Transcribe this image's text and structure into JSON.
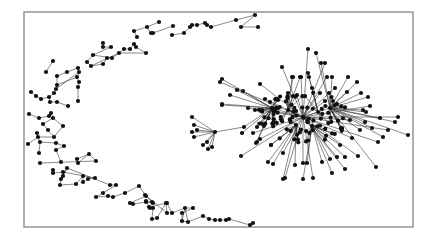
{
  "diagram": {
    "type": "network-graph",
    "caption": "",
    "frame": {
      "x": 24,
      "y": 12,
      "width": 389,
      "height": 215,
      "color": "#7a7a7a"
    },
    "node_color": "#111111",
    "edge_color": "#3a3a3a",
    "node_radius": 2.1,
    "arc_nodes": [
      [
        134,
        31
      ],
      [
        147,
        27
      ],
      [
        159,
        22
      ],
      [
        151,
        33
      ],
      [
        153,
        33
      ],
      [
        137,
        37
      ],
      [
        173,
        26
      ],
      [
        172,
        35
      ],
      [
        184,
        33
      ],
      [
        190,
        27
      ],
      [
        192,
        25
      ],
      [
        197,
        25
      ],
      [
        205,
        23
      ],
      [
        207,
        25
      ],
      [
        211,
        27
      ],
      [
        236,
        20
      ],
      [
        255,
        15
      ],
      [
        241,
        27
      ],
      [
        258,
        27
      ],
      [
        53,
        61
      ],
      [
        46,
        72
      ],
      [
        57,
        76
      ],
      [
        67,
        72
      ],
      [
        78,
        68
      ],
      [
        79,
        72
      ],
      [
        77,
        77
      ],
      [
        79,
        82
      ],
      [
        78,
        87
      ],
      [
        78,
        101
      ],
      [
        57,
        85
      ],
      [
        56,
        89
      ],
      [
        54,
        93
      ],
      [
        31,
        92
      ],
      [
        36,
        96
      ],
      [
        41,
        99
      ],
      [
        49,
        97
      ],
      [
        50,
        102
      ],
      [
        57,
        102
      ],
      [
        68,
        106
      ],
      [
        103,
        43
      ],
      [
        103,
        47
      ],
      [
        111,
        47
      ],
      [
        93,
        55
      ],
      [
        87,
        62
      ],
      [
        91,
        66
      ],
      [
        103,
        64
      ],
      [
        107,
        58
      ],
      [
        112,
        58
      ],
      [
        119,
        53
      ],
      [
        124,
        49
      ],
      [
        130,
        49
      ],
      [
        134,
        44
      ],
      [
        136,
        47
      ],
      [
        146,
        53
      ],
      [
        29,
        114
      ],
      [
        39,
        118
      ],
      [
        49,
        116
      ],
      [
        51,
        113
      ],
      [
        53,
        118
      ],
      [
        43,
        124
      ],
      [
        48,
        130
      ],
      [
        63,
        126
      ],
      [
        54,
        137
      ],
      [
        37,
        133
      ],
      [
        38,
        137
      ],
      [
        28,
        144
      ],
      [
        40,
        142
      ],
      [
        39,
        153
      ],
      [
        56,
        143
      ],
      [
        64,
        146
      ],
      [
        56,
        150
      ],
      [
        61,
        162
      ],
      [
        77,
        159
      ],
      [
        89,
        154
      ],
      [
        78,
        163
      ],
      [
        96,
        161
      ],
      [
        40,
        163
      ],
      [
        53,
        170
      ],
      [
        53,
        173
      ],
      [
        63,
        172
      ],
      [
        63,
        176
      ],
      [
        67,
        168
      ],
      [
        61,
        179
      ],
      [
        60,
        185
      ],
      [
        76,
        184
      ],
      [
        83,
        176
      ],
      [
        83,
        182
      ],
      [
        88,
        179
      ],
      [
        95,
        178
      ],
      [
        110,
        185
      ],
      [
        116,
        185
      ],
      [
        103,
        193
      ],
      [
        96,
        197
      ],
      [
        108,
        196
      ],
      [
        113,
        197
      ],
      [
        125,
        193
      ],
      [
        139,
        186
      ],
      [
        146,
        196
      ],
      [
        130,
        203
      ],
      [
        133,
        204
      ],
      [
        146,
        202
      ],
      [
        152,
        202
      ],
      [
        150,
        208
      ],
      [
        153,
        208
      ],
      [
        152,
        219
      ],
      [
        157,
        218
      ],
      [
        166,
        203
      ],
      [
        167,
        213
      ],
      [
        145,
        195
      ],
      [
        146,
        201
      ],
      [
        153,
        203
      ],
      [
        149,
        207
      ],
      [
        167,
        203
      ],
      [
        172,
        213
      ],
      [
        185,
        208
      ],
      [
        193,
        208
      ],
      [
        182,
        213
      ],
      [
        182,
        221
      ],
      [
        188,
        222
      ],
      [
        203,
        216
      ],
      [
        209,
        219
      ],
      [
        215,
        220
      ],
      [
        220,
        220
      ],
      [
        226,
        220
      ],
      [
        229,
        219
      ],
      [
        250,
        225
      ],
      [
        253,
        223
      ]
    ],
    "arc_edges": [
      [
        0,
        1
      ],
      [
        1,
        2
      ],
      [
        1,
        3
      ],
      [
        3,
        4
      ],
      [
        0,
        5
      ],
      [
        4,
        6
      ],
      [
        7,
        8
      ],
      [
        8,
        9
      ],
      [
        9,
        10
      ],
      [
        10,
        11
      ],
      [
        11,
        12
      ],
      [
        12,
        13
      ],
      [
        13,
        14
      ],
      [
        14,
        15
      ],
      [
        15,
        16
      ],
      [
        16,
        17
      ],
      [
        17,
        18
      ],
      [
        19,
        20
      ],
      [
        21,
        22
      ],
      [
        22,
        23
      ],
      [
        23,
        24
      ],
      [
        24,
        25
      ],
      [
        25,
        26
      ],
      [
        26,
        27
      ],
      [
        27,
        28
      ],
      [
        21,
        29
      ],
      [
        29,
        30
      ],
      [
        30,
        31
      ],
      [
        29,
        25
      ],
      [
        30,
        24
      ],
      [
        32,
        33
      ],
      [
        33,
        34
      ],
      [
        34,
        35
      ],
      [
        35,
        36
      ],
      [
        36,
        37
      ],
      [
        37,
        38
      ],
      [
        35,
        31
      ],
      [
        39,
        40
      ],
      [
        40,
        41
      ],
      [
        41,
        42
      ],
      [
        42,
        43
      ],
      [
        43,
        44
      ],
      [
        44,
        45
      ],
      [
        45,
        46
      ],
      [
        46,
        47
      ],
      [
        47,
        48
      ],
      [
        48,
        49
      ],
      [
        49,
        50
      ],
      [
        50,
        51
      ],
      [
        51,
        52
      ],
      [
        52,
        53
      ],
      [
        42,
        47
      ],
      [
        44,
        48
      ],
      [
        48,
        53
      ],
      [
        54,
        55
      ],
      [
        55,
        56
      ],
      [
        56,
        57
      ],
      [
        57,
        58
      ],
      [
        58,
        59
      ],
      [
        59,
        60
      ],
      [
        58,
        61
      ],
      [
        60,
        62
      ],
      [
        61,
        62
      ],
      [
        63,
        64
      ],
      [
        64,
        65
      ],
      [
        64,
        66
      ],
      [
        66,
        67
      ],
      [
        66,
        68
      ],
      [
        68,
        69
      ],
      [
        69,
        70
      ],
      [
        70,
        71
      ],
      [
        62,
        64
      ],
      [
        72,
        73
      ],
      [
        73,
        74
      ],
      [
        73,
        75
      ],
      [
        75,
        76
      ],
      [
        77,
        78
      ],
      [
        78,
        79
      ],
      [
        79,
        80
      ],
      [
        80,
        81
      ],
      [
        81,
        82
      ],
      [
        82,
        83
      ],
      [
        83,
        84
      ],
      [
        84,
        85
      ],
      [
        85,
        86
      ],
      [
        86,
        87
      ],
      [
        87,
        88
      ],
      [
        81,
        89
      ],
      [
        79,
        88
      ],
      [
        89,
        90
      ],
      [
        90,
        91
      ],
      [
        91,
        92
      ],
      [
        92,
        93
      ],
      [
        93,
        94
      ],
      [
        94,
        95
      ],
      [
        95,
        96
      ],
      [
        96,
        97
      ],
      [
        97,
        98
      ],
      [
        98,
        99
      ],
      [
        99,
        100
      ],
      [
        100,
        101
      ],
      [
        97,
        101
      ],
      [
        102,
        103
      ],
      [
        103,
        104
      ],
      [
        104,
        105
      ],
      [
        105,
        106
      ],
      [
        106,
        107
      ],
      [
        107,
        108
      ],
      [
        109,
        110
      ],
      [
        110,
        111
      ],
      [
        111,
        112
      ],
      [
        112,
        113
      ],
      [
        113,
        114
      ],
      [
        114,
        115
      ],
      [
        115,
        116
      ],
      [
        116,
        117
      ],
      [
        117,
        118
      ],
      [
        118,
        119
      ],
      [
        119,
        120
      ],
      [
        120,
        121
      ],
      [
        121,
        122
      ],
      [
        122,
        123
      ],
      [
        123,
        124
      ],
      [
        124,
        125
      ],
      [
        125,
        126
      ],
      [
        126,
        127
      ],
      [
        127,
        128
      ],
      [
        128,
        129
      ],
      [
        114,
        117
      ],
      [
        114,
        118
      ],
      [
        109,
        102
      ]
    ],
    "cluster": {
      "hub": [
        303,
        117
      ],
      "secondary_hubs": [
        [
          288,
          110
        ],
        [
          318,
          112
        ],
        [
          296,
          125
        ],
        [
          312,
          126
        ],
        [
          272,
          108
        ],
        [
          330,
          108
        ]
      ],
      "star_hub": [
        215,
        132
      ],
      "star_leaves": [
        [
          192,
          117
        ],
        [
          194,
          125
        ],
        [
          192,
          132
        ],
        [
          197,
          130
        ],
        [
          194,
          137
        ],
        [
          203,
          145
        ],
        [
          207,
          142
        ],
        [
          208,
          149
        ],
        [
          212,
          147
        ]
      ],
      "outer_nodes": [
        [
          282,
          67
        ],
        [
          292,
          77
        ],
        [
          300,
          77
        ],
        [
          308,
          49
        ],
        [
          316,
          53
        ],
        [
          321,
          63
        ],
        [
          325,
          63
        ],
        [
          348,
          77
        ],
        [
          293,
          77
        ],
        [
          301,
          77
        ],
        [
          308,
          73
        ],
        [
          309,
          77
        ],
        [
          327,
          77
        ],
        [
          332,
          77
        ],
        [
          357,
          82
        ],
        [
          335,
          88
        ],
        [
          361,
          93
        ],
        [
          347,
          92
        ],
        [
          320,
          93
        ],
        [
          329,
          93
        ],
        [
          368,
          97
        ],
        [
          370,
          106
        ],
        [
          363,
          110
        ],
        [
          366,
          112
        ],
        [
          398,
          117
        ],
        [
          333,
          101
        ],
        [
          337,
          104
        ],
        [
          325,
          101
        ],
        [
          312,
          88
        ],
        [
          288,
          93
        ],
        [
          297,
          95
        ],
        [
          277,
          99
        ],
        [
          222,
          79
        ],
        [
          220,
          82
        ],
        [
          237,
          90
        ],
        [
          243,
          91
        ],
        [
          260,
          84
        ],
        [
          230,
          95
        ],
        [
          222,
          104
        ],
        [
          265,
          99
        ],
        [
          270,
          102
        ],
        [
          278,
          100
        ],
        [
          248,
          108
        ],
        [
          255,
          110
        ],
        [
          262,
          110
        ],
        [
          275,
          111
        ],
        [
          408,
          135
        ],
        [
          383,
          137
        ],
        [
          358,
          156
        ],
        [
          376,
          167
        ],
        [
          345,
          157
        ],
        [
          345,
          169
        ],
        [
          332,
          173
        ],
        [
          330,
          159
        ],
        [
          337,
          157
        ],
        [
          322,
          162
        ],
        [
          295,
          165
        ],
        [
          285,
          178
        ],
        [
          283,
          179
        ],
        [
          303,
          179
        ],
        [
          313,
          178
        ],
        [
          268,
          162
        ],
        [
          273,
          164
        ],
        [
          283,
          153
        ],
        [
          256,
          143
        ],
        [
          271,
          145
        ],
        [
          303,
          163
        ],
        [
          307,
          163
        ],
        [
          222,
          105
        ],
        [
          241,
          156
        ],
        [
          244,
          127
        ],
        [
          242,
          133
        ],
        [
          253,
          133
        ],
        [
          257,
          127
        ],
        [
          257,
          142
        ],
        [
          260,
          139
        ],
        [
          271,
          145
        ],
        [
          395,
          122
        ],
        [
          388,
          130
        ],
        [
          380,
          118
        ],
        [
          372,
          128
        ],
        [
          352,
          138
        ],
        [
          360,
          130
        ],
        [
          340,
          145
        ],
        [
          350,
          120
        ],
        [
          342,
          128
        ],
        [
          365,
          122
        ],
        [
          378,
          142
        ]
      ],
      "dense_core_count": 90,
      "dense_core_spread": [
        46,
        26
      ]
    }
  }
}
